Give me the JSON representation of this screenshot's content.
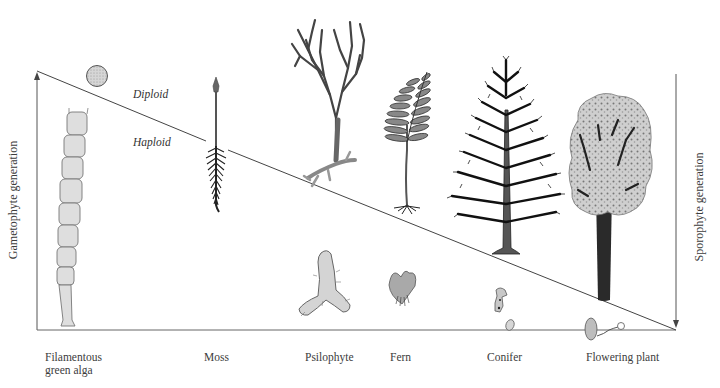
{
  "diagram": {
    "type": "alternation-of-generations",
    "axes": {
      "left_label": "Gametophyte generation",
      "right_label": "Sporophyte generation"
    },
    "zones": {
      "upper": "Diploid",
      "lower": "Haploid"
    },
    "organisms": [
      {
        "label": "Filamentous\ngreen alga",
        "line1": "Filamentous",
        "line2": "green alga"
      },
      {
        "label": "Moss"
      },
      {
        "label": "Psilophyte"
      },
      {
        "label": "Fern"
      },
      {
        "label": "Conifer"
      },
      {
        "label": "Flowering plant"
      }
    ],
    "colors": {
      "line": "#555555",
      "ink": "#222222",
      "fill_light": "#d9d9d9",
      "fill_mid": "#8a8a8a",
      "trunk": "#3a3a3a"
    }
  }
}
